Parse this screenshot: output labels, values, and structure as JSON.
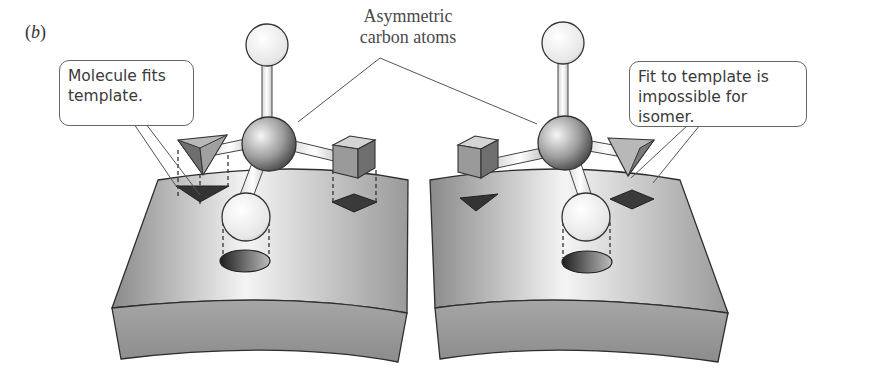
{
  "figure": {
    "panel_label_prefix": "(",
    "panel_label_letter": "b",
    "panel_label_suffix": ")",
    "caption_line1": "Asymmetric",
    "caption_line2": "carbon atoms",
    "callout_left_line1": "Molecule fits",
    "callout_left_line2": "template.",
    "callout_right_line1": "Fit to template is",
    "callout_right_line2": "impossible for isomer.",
    "colors": {
      "surface_light": "#f2f2f2",
      "surface_dark": "#8f8f8f",
      "edge": "#2e2e2e",
      "text": "#3a3a3a"
    }
  }
}
